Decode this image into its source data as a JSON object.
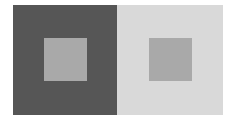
{
  "figure": {
    "title": "",
    "panels": [
      {
        "name": "left",
        "background_color": "#565656",
        "center_square_color": "#a9a9a9"
      },
      {
        "name": "right",
        "background_color": "#d9d9d9",
        "center_square_color": "#a9a9a9"
      }
    ]
  }
}
